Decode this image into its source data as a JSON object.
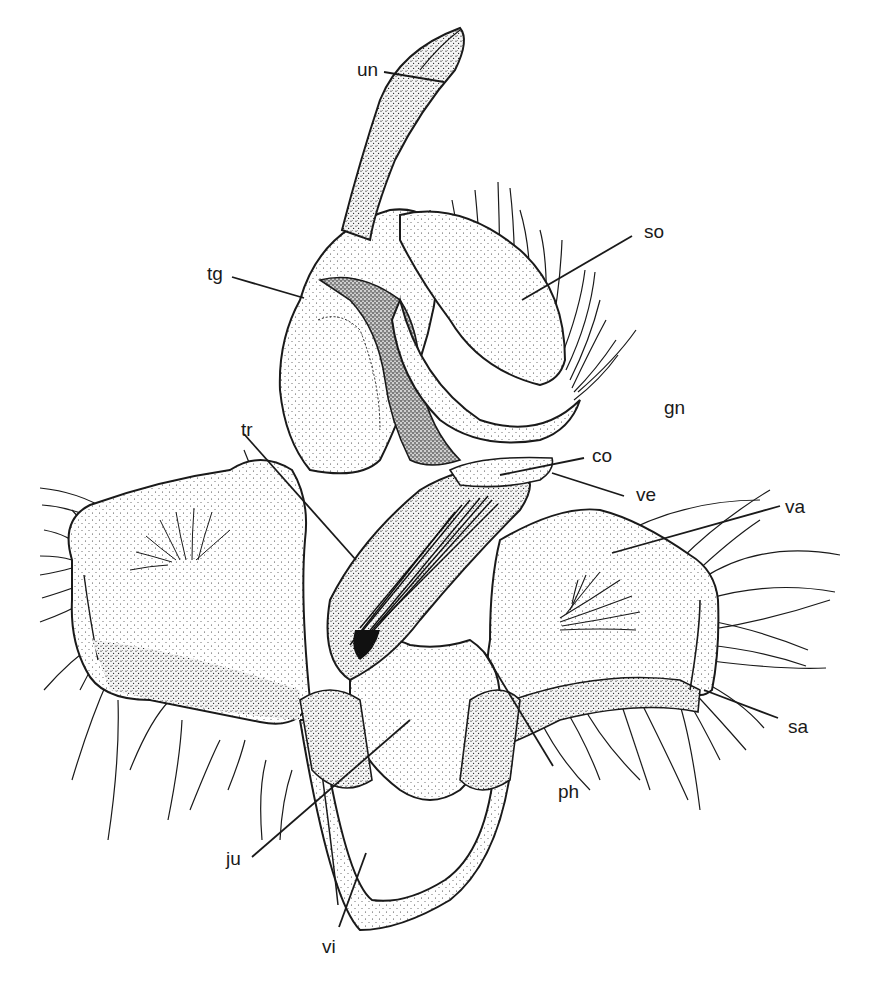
{
  "figure": {
    "background": "#ffffff",
    "ink": "#1a1a1a",
    "labels": [
      {
        "id": "un",
        "text": "un",
        "x": 357,
        "y": 60,
        "line": [
          [
            384,
            72
          ],
          [
            444,
            82
          ]
        ]
      },
      {
        "id": "so",
        "text": "so",
        "x": 644,
        "y": 222,
        "line": [
          [
            632,
            236
          ],
          [
            522,
            300
          ]
        ]
      },
      {
        "id": "tg",
        "text": "tg",
        "x": 207,
        "y": 264,
        "line": [
          [
            232,
            277
          ],
          [
            304,
            298
          ]
        ]
      },
      {
        "id": "gn",
        "text": "gn",
        "x": 664,
        "y": 398,
        "line": null
      },
      {
        "id": "tr",
        "text": "tr",
        "x": 241,
        "y": 420,
        "line": [
          [
            244,
            434
          ],
          [
            356,
            560
          ]
        ]
      },
      {
        "id": "co",
        "text": "co",
        "x": 592,
        "y": 446,
        "line": [
          [
            584,
            458
          ],
          [
            500,
            475
          ]
        ]
      },
      {
        "id": "ve",
        "text": "ve",
        "x": 636,
        "y": 485,
        "line": [
          [
            624,
            496
          ],
          [
            552,
            473
          ]
        ]
      },
      {
        "id": "va",
        "text": "va",
        "x": 785,
        "y": 497,
        "line": [
          [
            780,
            506
          ],
          [
            612,
            553
          ]
        ]
      },
      {
        "id": "sa",
        "text": "sa",
        "x": 788,
        "y": 717,
        "line": [
          [
            778,
            718
          ],
          [
            704,
            690
          ]
        ]
      },
      {
        "id": "ph",
        "text": "ph",
        "x": 558,
        "y": 782,
        "line": [
          [
            553,
            766
          ],
          [
            484,
            652
          ]
        ]
      },
      {
        "id": "ju",
        "text": "ju",
        "x": 226,
        "y": 849,
        "line": [
          [
            252,
            857
          ],
          [
            410,
            720
          ]
        ]
      },
      {
        "id": "vi",
        "text": "vi",
        "x": 322,
        "y": 937,
        "line": [
          [
            339,
            927
          ],
          [
            366,
            853
          ]
        ]
      }
    ]
  }
}
